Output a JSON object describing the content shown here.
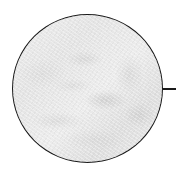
{
  "figure": {
    "type": "magnified-inset",
    "inset_shape": "circle",
    "outline_color": "#1a1a1a",
    "texture_base_color": "#e8e8e8",
    "texture_shadow_color": "#c8c8c8",
    "leader_line": {
      "direction": "right",
      "color": "#1a1a1a"
    }
  }
}
